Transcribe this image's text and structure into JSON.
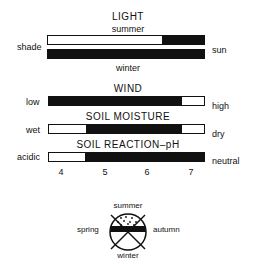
{
  "light": {
    "title": "LIGHT",
    "top_label": "summer",
    "bottom_label": "winter",
    "left_label": "shade",
    "right_label": "sun",
    "summer_bar": {
      "black_from": 0.73,
      "black_to": 1.0
    },
    "winter_bar": {
      "black_from": 0.0,
      "black_to": 1.0
    }
  },
  "wind": {
    "title": "WIND",
    "left_label": "low",
    "right_label": "high",
    "bar": {
      "black_from": 0.0,
      "black_to": 0.86
    }
  },
  "soil_moisture": {
    "title": "SOIL MOISTURE",
    "left_label": "wet",
    "right_label": "dry",
    "bar": {
      "black_from": 0.24,
      "black_to": 0.86
    }
  },
  "soil_reaction": {
    "title": "SOIL REACTION–pH",
    "left_label": "acidic",
    "right_label": "neutral",
    "bar": {
      "black_from": 0.23,
      "black_to": 1.0
    },
    "ticks": [
      "4",
      "5",
      "6",
      "7"
    ]
  },
  "seasons": {
    "top": "summer",
    "bottom": "winter",
    "left": "spring",
    "right": "autumn",
    "icon": "season-circle-icon"
  },
  "colors": {
    "ink": "#111111",
    "background": "#ffffff"
  }
}
